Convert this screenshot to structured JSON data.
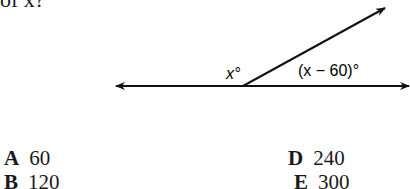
{
  "question": {
    "stem_fragment": "of x?"
  },
  "figure": {
    "label_left_angle": "x°",
    "label_right_angle": "(x − 60)°"
  },
  "options": [
    {
      "letter": "A",
      "value": "60"
    },
    {
      "letter": "B",
      "value": "120"
    },
    {
      "letter": "D",
      "value": "240"
    },
    {
      "letter": "E",
      "value": "300"
    }
  ]
}
